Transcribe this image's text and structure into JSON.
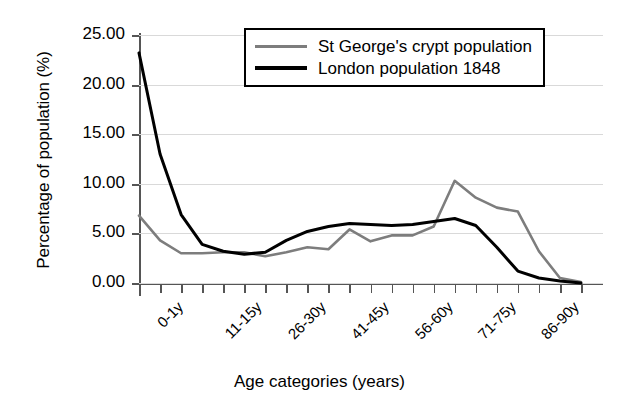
{
  "chart_data": {
    "type": "line",
    "title": "",
    "xlabel": "Age categories (years)",
    "ylabel": "Percentage of population (%)",
    "ylim": [
      0,
      25
    ],
    "ytick_values": [
      0,
      5,
      10,
      15,
      20,
      25
    ],
    "ytick_labels": [
      "0.00",
      "5.00",
      "10.00",
      "15.00",
      "20.00",
      "25.00"
    ],
    "grid": true,
    "legend_position": "top-right-inside",
    "categories": [
      "0-1y",
      "2-5y",
      "6-10y",
      "11-15y",
      "16-20y",
      "21-25y",
      "26-30y",
      "31-35y",
      "36-40y",
      "41-45y",
      "46-50y",
      "51-55y",
      "56-60y",
      "61-65y",
      "66-70y",
      "71-75y",
      "76-80y",
      "81-85y",
      "86-90y",
      "91-95y",
      "96-100y",
      "100y+"
    ],
    "xtick_labels_shown": [
      "0-1y",
      "11-15y",
      "26-30y",
      "41-45y",
      "56-60y",
      "71-75y",
      "86-90y"
    ],
    "xtick_label_interval": 3,
    "xtick_label_rotation": -45,
    "series": [
      {
        "name": "St George's crypt population",
        "color": "#7d7d7d",
        "width": 2.6,
        "values": [
          6.8,
          4.3,
          3.0,
          3.0,
          3.1,
          3.1,
          2.7,
          3.1,
          3.6,
          3.4,
          5.4,
          4.2,
          4.8,
          4.8,
          5.7,
          10.3,
          8.6,
          7.6,
          7.2,
          3.2,
          0.5,
          0.1
        ]
      },
      {
        "name": "London population 1848",
        "color": "#000000",
        "width": 3.0,
        "values": [
          23.2,
          13.0,
          6.9,
          3.9,
          3.2,
          2.9,
          3.1,
          4.3,
          5.2,
          5.7,
          6.0,
          5.9,
          5.8,
          5.9,
          6.2,
          6.5,
          5.8,
          3.6,
          1.2,
          0.5,
          0.2,
          0.0
        ]
      }
    ]
  },
  "legend": {
    "entries": [
      {
        "label": "St George's crypt population",
        "color": "#7d7d7d",
        "width": 3
      },
      {
        "label": "London population 1848",
        "color": "#000000",
        "width": 4
      }
    ]
  }
}
